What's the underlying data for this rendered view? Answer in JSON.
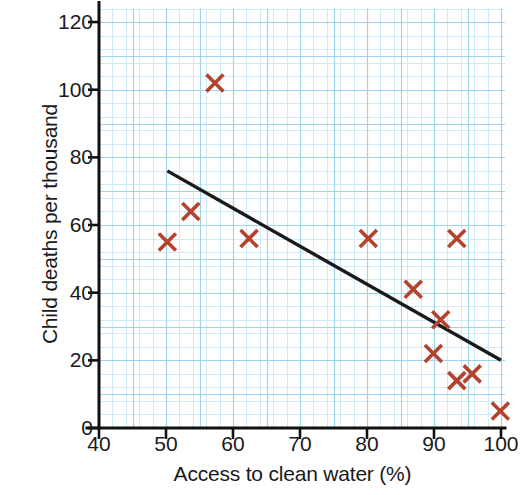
{
  "chart_data": {
    "type": "scatter",
    "title": "",
    "xlabel": "Access to clean water (%)",
    "ylabel": "Child deaths per thousand",
    "xlim": [
      40,
      100
    ],
    "ylim": [
      0,
      124
    ],
    "x_ticks": [
      40,
      50,
      60,
      70,
      80,
      90,
      100
    ],
    "y_ticks": [
      0,
      20,
      40,
      60,
      80,
      100,
      120
    ],
    "x_tick_labels": [
      "40",
      "50",
      "60",
      "70",
      "80",
      "90",
      "100"
    ],
    "y_tick_labels": [
      "0",
      "20",
      "40",
      "60",
      "80",
      "100",
      "120"
    ],
    "grid": true,
    "grid_minor_step_x": 2,
    "grid_minor_step_y": 4,
    "grid_major_step_x": 10,
    "grid_major_step_y": 20,
    "legend": null,
    "marker": "x-cross",
    "marker_color": "#b5422c",
    "grid_color": "#9fd4ee",
    "grid_minor_color": "#cfeaf8",
    "axis_color": "#111111",
    "trendline_color": "#1a1a1a",
    "points": [
      {
        "x": 50.2,
        "y": 55
      },
      {
        "x": 53.7,
        "y": 64
      },
      {
        "x": 57.3,
        "y": 102
      },
      {
        "x": 62.4,
        "y": 56
      },
      {
        "x": 80.2,
        "y": 56
      },
      {
        "x": 86.9,
        "y": 41
      },
      {
        "x": 89.9,
        "y": 22
      },
      {
        "x": 91.0,
        "y": 32
      },
      {
        "x": 93.4,
        "y": 14
      },
      {
        "x": 93.4,
        "y": 56
      },
      {
        "x": 95.7,
        "y": 16
      },
      {
        "x": 99.9,
        "y": 5
      }
    ],
    "trendline": {
      "x1": 50.2,
      "y1": 76,
      "x2": 100,
      "y2": 20
    }
  }
}
